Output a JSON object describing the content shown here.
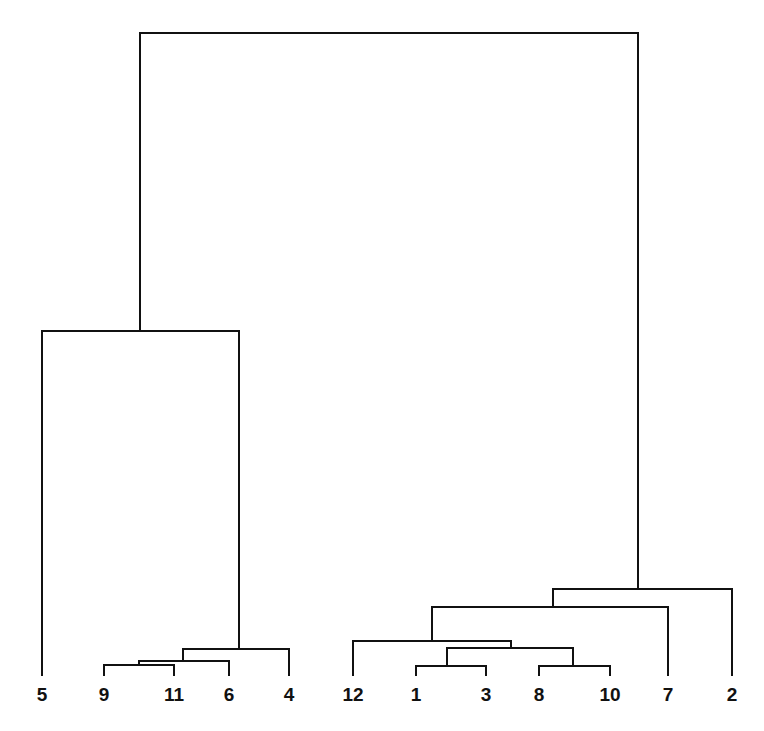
{
  "diagram": {
    "type": "dendrogram",
    "orientation": "top-down",
    "line_color": "#111111",
    "background": "#ffffff",
    "leaf_order": [
      "5",
      "9",
      "11",
      "6",
      "4",
      "12",
      "1",
      "3",
      "8",
      "10",
      "7",
      "2"
    ],
    "leaves": [
      {
        "label": "5",
        "x": 42
      },
      {
        "label": "9",
        "x": 104
      },
      {
        "label": "11",
        "x": 174
      },
      {
        "label": "6",
        "x": 229
      },
      {
        "label": "4",
        "x": 289
      },
      {
        "label": "12",
        "x": 353
      },
      {
        "label": "1",
        "x": 416
      },
      {
        "label": "3",
        "x": 486
      },
      {
        "label": "8",
        "x": 539
      },
      {
        "label": "10",
        "x": 610
      },
      {
        "label": "7",
        "x": 668
      },
      {
        "label": "2",
        "x": 732
      }
    ],
    "leaf_bottom_y": 676,
    "label_baseline_y": 701,
    "merges": [
      {
        "name": "9+11",
        "left_x": 104,
        "left_y": 676,
        "right_x": 174,
        "right_y": 676,
        "y": 665,
        "stem_x": 139
      },
      {
        "name": "(9,11)+6",
        "left_x": 139,
        "left_y": 665,
        "right_x": 229,
        "right_y": 676,
        "y": 661,
        "stem_x": 183
      },
      {
        "name": "(9,11,6)+4",
        "left_x": 183,
        "left_y": 661,
        "right_x": 289,
        "right_y": 676,
        "y": 649,
        "stem_x": 239
      },
      {
        "name": "5+(9,11,6,4)",
        "left_x": 42,
        "left_y": 676,
        "right_x": 239,
        "right_y": 649,
        "y": 331,
        "stem_x": 140
      },
      {
        "name": "1+3",
        "left_x": 416,
        "left_y": 676,
        "right_x": 486,
        "right_y": 676,
        "y": 666,
        "stem_x": 447
      },
      {
        "name": "8+10",
        "left_x": 539,
        "left_y": 676,
        "right_x": 610,
        "right_y": 676,
        "y": 666,
        "stem_x": 573
      },
      {
        "name": "(1,3)+(8,10)",
        "left_x": 447,
        "left_y": 666,
        "right_x": 573,
        "right_y": 666,
        "y": 648,
        "stem_x": 511
      },
      {
        "name": "12+(1,3,8,10)",
        "left_x": 353,
        "left_y": 676,
        "right_x": 511,
        "right_y": 648,
        "y": 641,
        "stem_x": 432
      },
      {
        "name": "(12,...)+7",
        "left_x": 432,
        "left_y": 641,
        "right_x": 668,
        "right_y": 676,
        "y": 607,
        "stem_x": 553
      },
      {
        "name": "(12,...,7)+2",
        "left_x": 553,
        "left_y": 607,
        "right_x": 732,
        "right_y": 676,
        "y": 589,
        "stem_x": 638
      },
      {
        "name": "root",
        "left_x": 140,
        "left_y": 331,
        "right_x": 638,
        "right_y": 589,
        "y": 33,
        "stem_x": null
      }
    ]
  }
}
